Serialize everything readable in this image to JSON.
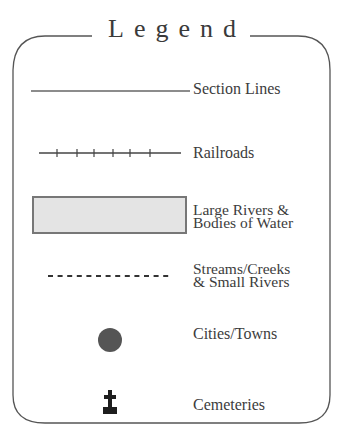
{
  "legend": {
    "title": "Legend",
    "colors": {
      "border": "#555555",
      "text": "#3c3c3c",
      "water_fill": "#e4e4e4",
      "water_border": "#777777",
      "city_dot": "#555555",
      "cemetery": "#1e1e1e"
    },
    "items": [
      {
        "symbol": "section-line-solid",
        "label": "Section Lines"
      },
      {
        "symbol": "railroad-tick-line",
        "label": "Railroads"
      },
      {
        "symbol": "water-rectangle",
        "label_line1": "Large Rivers &",
        "label_line2": "Bodies of Water"
      },
      {
        "symbol": "dashed-line",
        "label_line1": "Streams/Creeks",
        "label_line2": "& Small Rivers"
      },
      {
        "symbol": "city-dot",
        "label": "Cities/Towns"
      },
      {
        "symbol": "cemetery-cross",
        "label": "Cemeteries"
      }
    ]
  }
}
